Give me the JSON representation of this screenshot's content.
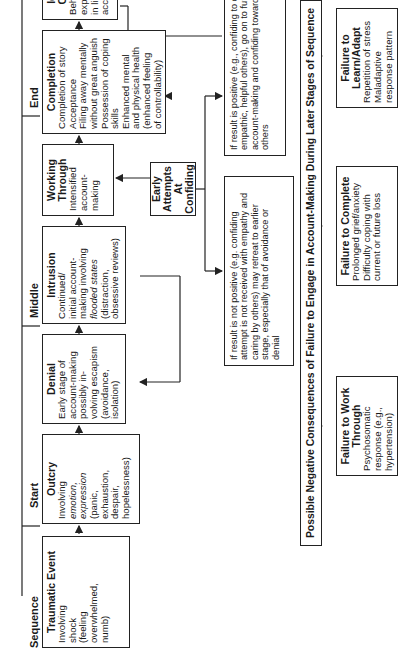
{
  "phases": {
    "sequence": "Sequence",
    "start": "Start",
    "middle": "Middle",
    "end": "End"
  },
  "stages": [
    {
      "title": "Traumatic Event",
      "lines": [
        "Involving",
        "shock",
        "(feeling",
        "overwhelmed,",
        "numb)"
      ]
    },
    {
      "title": "Outcry",
      "lines": [
        "Involving",
        "emotion,",
        "expression",
        "(panic,",
        "exhaustion,",
        "despair,",
        "hopelessness)"
      ]
    },
    {
      "title": "Denial",
      "lines": [
        "Early stage of",
        "account-making",
        "possibly in-",
        "volving escapism",
        "(avoidance,",
        "isolation)"
      ]
    },
    {
      "title": "Intrusion",
      "lines": [
        "Continued/",
        "initial account-",
        "making involving",
        "flooded states",
        "(distraction,",
        "obsessive reviews)"
      ]
    },
    {
      "title": "Working Through",
      "lines": [
        "Intensified",
        "account-",
        "making"
      ]
    },
    {
      "title": "Completion",
      "lines": [
        "Completion of story",
        "Acceptance",
        "Filing away mentally",
        "without great anguish",
        "Possession of coping",
        "skills",
        "Enhanced mental",
        "and physical health",
        "(enhanced feeling",
        "of controllability)"
      ]
    },
    {
      "title": "Identity Change",
      "lines": [
        "Behavioral",
        "expectations",
        "in line with",
        "account"
      ]
    }
  ],
  "confiding": {
    "title": "Early Attempts At Confiding"
  },
  "notes": {
    "negative": "If result is not positive (e.g. confiding attempt is not received with empathy and caring by others) may retreat to earlier stage, especially that of avoidance or denial",
    "positive": "If result is positive (e.g., confiding to caring, empathic, helpful others), go on to further account-making and confiding toward others"
  },
  "banner": "Possible Negative Consequences of Failure to Engage in Account-Making During Later Stages of Sequence",
  "failures": [
    {
      "title": "Failure to Work Through",
      "lines": [
        "Psychosomatic",
        "response (e.g.,",
        "hypertension)"
      ]
    },
    {
      "title": "Failure to Complete",
      "lines": [
        "Prolonged grief/anxiety",
        "Difficulty coping with",
        "current or future loss"
      ]
    },
    {
      "title": "Failure to Learn/Adapt",
      "lines": [
        "Repetition of stress",
        "Maladaptive",
        "response pattern"
      ]
    }
  ]
}
